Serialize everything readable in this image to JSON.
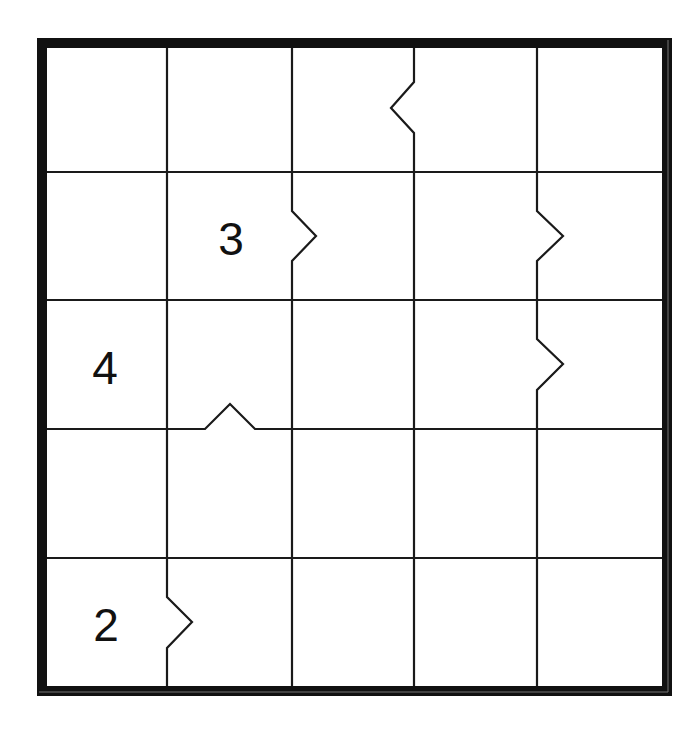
{
  "puzzle": {
    "type": "jigsaw-number-grid",
    "rows": 5,
    "cols": 5,
    "frame": {
      "x1": 42,
      "y1": 43,
      "x2": 667,
      "y2": 691,
      "thickness": 10,
      "color": "#111111"
    },
    "grid_line_color": "#1a1a1a",
    "col_lines_x": [
      42,
      167,
      292,
      414,
      537,
      667
    ],
    "row_lines_y": [
      43,
      172,
      300,
      429,
      558,
      691
    ],
    "clues": [
      {
        "row": 1,
        "col": 1,
        "value": "3",
        "x": 231,
        "y": 239
      },
      {
        "row": 2,
        "col": 0,
        "value": "4",
        "x": 105,
        "y": 368
      },
      {
        "row": 4,
        "col": 0,
        "value": "2",
        "x": 106,
        "y": 625
      }
    ],
    "notches": [
      {
        "line": "vertical",
        "x": 414,
        "from": 82,
        "to": 133,
        "tip": [
          391,
          108
        ],
        "direction": "left",
        "between": "r0c2-r0c3"
      },
      {
        "line": "vertical",
        "x": 292,
        "from": 211,
        "to": 261,
        "tip": [
          316,
          236
        ],
        "direction": "right",
        "between": "r1c1-r1c2"
      },
      {
        "line": "vertical",
        "x": 537,
        "from": 211,
        "to": 261,
        "tip": [
          563,
          236
        ],
        "direction": "right",
        "between": "r1c3-r1c4"
      },
      {
        "line": "vertical",
        "x": 537,
        "from": 339,
        "to": 390,
        "tip": [
          563,
          364
        ],
        "direction": "right",
        "between": "r2c3-r2c4"
      },
      {
        "line": "horizontal",
        "y": 429,
        "from": 205,
        "to": 255,
        "tip": [
          230,
          404
        ],
        "direction": "up",
        "between": "r2c1-r3c1"
      },
      {
        "line": "vertical",
        "x": 167,
        "from": 597,
        "to": 648,
        "tip": [
          192,
          622
        ],
        "direction": "right",
        "between": "r4c0-r4c1"
      }
    ]
  },
  "clue_labels": {
    "c0": "3",
    "c1": "4",
    "c2": "2"
  }
}
